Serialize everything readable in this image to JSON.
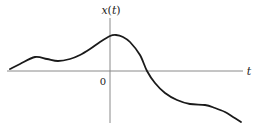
{
  "chart_data": {
    "type": "line",
    "title": "",
    "xlabel": "t",
    "ylabel": "x(t)",
    "origin_label": "0",
    "xlim": [
      -10.2,
      13.2
    ],
    "ylim": [
      -5.2,
      5.3
    ],
    "grid": false,
    "legend": "none",
    "series": [
      {
        "name": "x(t)",
        "color": "#1a1a1a",
        "points": [
          [
            -10.0,
            0.2
          ],
          [
            -9.0,
            0.7
          ],
          [
            -7.5,
            1.4
          ],
          [
            -6.3,
            1.2
          ],
          [
            -5.2,
            1.0
          ],
          [
            -4.0,
            1.2
          ],
          [
            -3.0,
            1.6
          ],
          [
            -2.0,
            2.2
          ],
          [
            -1.0,
            2.9
          ],
          [
            0.0,
            3.5
          ],
          [
            0.6,
            3.6
          ],
          [
            1.3,
            3.4
          ],
          [
            2.0,
            2.9
          ],
          [
            3.0,
            1.6
          ],
          [
            3.7,
            0.0
          ],
          [
            4.5,
            -1.2
          ],
          [
            5.5,
            -2.2
          ],
          [
            6.7,
            -2.9
          ],
          [
            8.0,
            -3.3
          ],
          [
            9.5,
            -3.4
          ],
          [
            10.5,
            -3.7
          ],
          [
            11.5,
            -4.1
          ],
          [
            12.3,
            -4.6
          ],
          [
            13.1,
            -5.1
          ]
        ]
      }
    ]
  }
}
